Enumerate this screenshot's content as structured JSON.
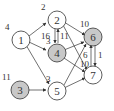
{
  "diagram": {
    "type": "directed-graph",
    "nodes": [
      {
        "id": "1",
        "label": "1",
        "weight": "4",
        "shaded": false
      },
      {
        "id": "2",
        "label": "2",
        "weight": "2",
        "shaded": false
      },
      {
        "id": "3",
        "label": "3",
        "weight": "11",
        "shaded": true
      },
      {
        "id": "4",
        "label": "4",
        "weight": "3",
        "shaded": true
      },
      {
        "id": "5",
        "label": "5",
        "weight": "3",
        "shaded": false
      },
      {
        "id": "6",
        "label": "6",
        "weight": "10",
        "shaded": true
      },
      {
        "id": "7",
        "label": "7",
        "weight": "",
        "shaded": false
      }
    ],
    "edge_labels": {
      "e24a": "16",
      "e24b": "11",
      "e76a": "6",
      "e76b": "10",
      "e67": "1"
    },
    "edges": [
      [
        "1",
        "2"
      ],
      [
        "1",
        "4"
      ],
      [
        "1",
        "5"
      ],
      [
        "3",
        "5"
      ],
      [
        "2",
        "4"
      ],
      [
        "4",
        "2"
      ],
      [
        "2",
        "6"
      ],
      [
        "2",
        "7"
      ],
      [
        "4",
        "6"
      ],
      [
        "4",
        "7"
      ],
      [
        "5",
        "6"
      ],
      [
        "5",
        "7"
      ],
      [
        "6",
        "7"
      ],
      [
        "7",
        "6"
      ]
    ]
  }
}
